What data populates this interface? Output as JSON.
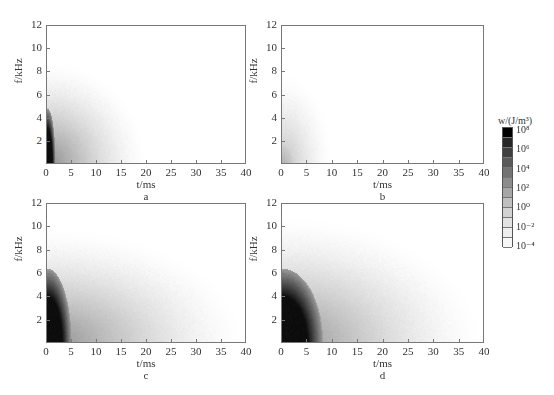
{
  "chart_data": [
    {
      "type": "heatmap",
      "panel": "a",
      "xlabel": "t/ms",
      "ylabel": "f/kHz",
      "x_ticks": [
        0,
        5,
        10,
        15,
        20,
        25,
        30,
        35,
        40
      ],
      "y_ticks": [
        2,
        4,
        6,
        8,
        10,
        12
      ],
      "xlim": [
        0,
        40
      ],
      "ylim": [
        0,
        12
      ],
      "energy_extent": {
        "t_max_ms": 20,
        "f_max_khz": 9,
        "dark_core_t_ms": 1,
        "dark_core_f_khz": 3
      }
    },
    {
      "type": "heatmap",
      "panel": "b",
      "xlabel": "t/ms",
      "ylabel": "f/kHz",
      "x_ticks": [
        0,
        5,
        10,
        15,
        20,
        25,
        30,
        35,
        40
      ],
      "y_ticks": [
        2,
        4,
        6,
        8,
        10,
        12
      ],
      "xlim": [
        0,
        40
      ],
      "ylim": [
        0,
        12
      ],
      "energy_extent": {
        "t_max_ms": 10,
        "f_max_khz": 8,
        "dark_core_t_ms": 0,
        "dark_core_f_khz": 0
      }
    },
    {
      "type": "heatmap",
      "panel": "c",
      "xlabel": "t/ms",
      "ylabel": "f/kHz",
      "x_ticks": [
        0,
        5,
        10,
        15,
        20,
        25,
        30,
        35,
        40
      ],
      "y_ticks": [
        2,
        4,
        6,
        8,
        10,
        12
      ],
      "xlim": [
        0,
        40
      ],
      "ylim": [
        0,
        12
      ],
      "energy_extent": {
        "t_max_ms": 40,
        "f_max_khz": 10,
        "dark_core_t_ms": 3,
        "dark_core_f_khz": 4
      }
    },
    {
      "type": "heatmap",
      "panel": "d",
      "xlabel": "t/ms",
      "ylabel": "f/kHz",
      "x_ticks": [
        0,
        5,
        10,
        15,
        20,
        25,
        30,
        35,
        40
      ],
      "y_ticks": [
        2,
        4,
        6,
        8,
        10,
        12
      ],
      "xlim": [
        0,
        40
      ],
      "ylim": [
        0,
        12
      ],
      "energy_extent": {
        "t_max_ms": 40,
        "f_max_khz": 11,
        "dark_core_t_ms": 5,
        "dark_core_f_khz": 4
      }
    }
  ],
  "colorbar": {
    "title": "w/(J/m³)",
    "ticks": [
      "10⁸",
      "10⁶",
      "10⁴",
      "10²",
      "10⁰",
      "10⁻²",
      "10⁻⁴"
    ],
    "scale": "log",
    "range": [
      -4,
      8
    ],
    "colors": [
      "#000000",
      "#262626",
      "#3f3f3f",
      "#595959",
      "#737373",
      "#8c8c8c",
      "#a6a6a6",
      "#bfbfbf",
      "#d2d2d2",
      "#e2e2e2",
      "#eeeeee",
      "#f7f7f7",
      "#ffffff"
    ]
  },
  "panels": {
    "a": {
      "label": "a",
      "xlabel": "t/ms",
      "ylabel": "f/kHz"
    },
    "b": {
      "label": "b",
      "xlabel": "t/ms",
      "ylabel": "f/kHz"
    },
    "c": {
      "label": "c",
      "xlabel": "t/ms",
      "ylabel": "f/kHz"
    },
    "d": {
      "label": "d",
      "xlabel": "t/ms",
      "ylabel": "f/kHz"
    }
  },
  "axes": {
    "x_ticks": [
      "0",
      "5",
      "10",
      "15",
      "20",
      "25",
      "30",
      "35",
      "40"
    ],
    "y_ticks": [
      "2",
      "4",
      "6",
      "8",
      "10",
      "12"
    ]
  }
}
